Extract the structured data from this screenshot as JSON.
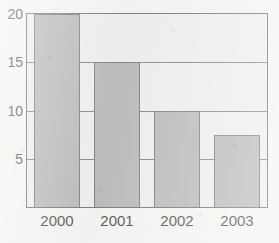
{
  "chart_data": {
    "type": "bar",
    "title": "",
    "xlabel": "",
    "ylabel": "",
    "categories": [
      "2000",
      "2001",
      "2002",
      "2003"
    ],
    "values": [
      20,
      15,
      10,
      7.5
    ],
    "ylim": [
      0,
      20
    ],
    "yticks": [
      5,
      10,
      15,
      20
    ],
    "ytick_labels": [
      "5",
      "10",
      "15",
      "20"
    ],
    "grid": true,
    "legend": false,
    "series": [
      {
        "name": "",
        "values": [
          20,
          15,
          10,
          7.5
        ]
      }
    ]
  },
  "style": {
    "bar_fill": "#a9a9a7",
    "bar_edge": "#5f5f5f",
    "plot_background": "#ebebe9",
    "page_background": "#f2f2f0",
    "axis_color": "#555555",
    "gridline_color": "#6a6a6a",
    "text_color": "#1f1f1f"
  },
  "title_remnant": ""
}
